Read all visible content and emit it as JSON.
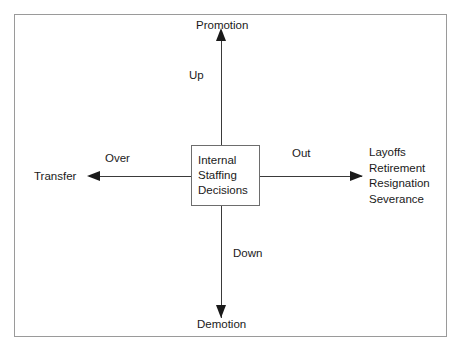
{
  "diagram": {
    "title": "Internal Staffing Decisions",
    "center_node": {
      "lines": [
        "Internal",
        "Staffing",
        "Decisions"
      ]
    },
    "directions": {
      "up": "Up",
      "down": "Down",
      "over": "Over",
      "out": "Out"
    },
    "endpoints": {
      "top": "Promotion",
      "bottom": "Demotion",
      "left": "Transfer",
      "right": [
        "Layoffs",
        "Retirement",
        "Resignation",
        "Severance"
      ]
    },
    "colors": {
      "frame_border": "#9a9a9a",
      "box_border": "#6d6d6d",
      "line": "#3a3a3a",
      "arrow": "#1a1a1a",
      "text": "#1a1a1a",
      "background": "#ffffff"
    }
  }
}
